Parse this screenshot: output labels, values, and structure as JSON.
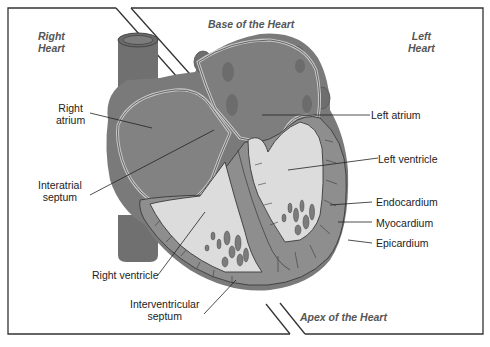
{
  "diagram": {
    "type": "anatomical-illustration",
    "colors": {
      "background": "#ffffff",
      "frame": "#333333",
      "tissue_dark": "#7a7a7a",
      "tissue_mid": "#8e8e8e",
      "vessel": "#707070",
      "chamber_light": "#dcdcdc",
      "wall_line": "#3a3a3a",
      "region_text": "#555555"
    },
    "regions": {
      "right_heart": [
        "Right",
        "Heart"
      ],
      "left_heart": [
        "Left",
        "Heart"
      ],
      "base": "Base of the Heart",
      "apex": "Apex of the Heart"
    },
    "labels": {
      "right_atrium": [
        "Right",
        "atrium"
      ],
      "interatrial_septum": [
        "Interatrial",
        "septum"
      ],
      "right_ventricle": "Right ventricle",
      "interventricular_septum": [
        "Interventricular",
        "septum"
      ],
      "left_atrium": "Left atrium",
      "left_ventricle": "Left ventricle",
      "endocardium": "Endocardium",
      "myocardium": "Myocardium",
      "epicardium": "Epicardium"
    }
  }
}
